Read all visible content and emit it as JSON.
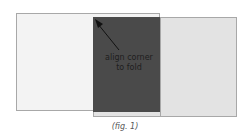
{
  "figure": {
    "label_line1": "align corner",
    "label_line2": "to fold",
    "caption": "(fig. 1)",
    "arrow_icon": "arrow-up-left-icon",
    "colors": {
      "left_sheet": "#f3f3f3",
      "right_sheet": "#e3e3e3",
      "dark_panel": "#4a4a4a",
      "border": "#a8a8a8"
    }
  }
}
